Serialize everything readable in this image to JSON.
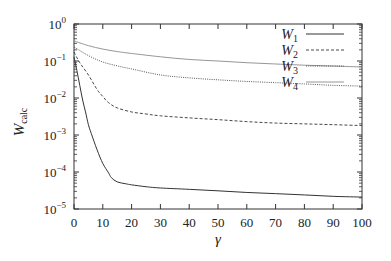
{
  "chart_data": {
    "type": "line",
    "title": "",
    "xlabel": "γ",
    "ylabel": "W",
    "ylabel_subscript": "calc",
    "xlim": [
      0,
      100
    ],
    "ylim": [
      1e-05,
      1
    ],
    "yscale": "log",
    "grid": false,
    "legend_position": "upper right",
    "x_ticks": [
      0,
      10,
      20,
      30,
      40,
      50,
      60,
      70,
      80,
      90,
      100
    ],
    "x_tick_labels": [
      "0",
      "10",
      "20",
      "30",
      "40",
      "50",
      "60",
      "70",
      "80",
      "90",
      "100"
    ],
    "y_ticks": [
      1,
      0.1,
      0.01,
      0.001,
      0.0001,
      1e-05
    ],
    "y_tick_labels": [
      {
        "base": "10",
        "exp": "0"
      },
      {
        "base": "10",
        "exp": "−1"
      },
      {
        "base": "10",
        "exp": "−2"
      },
      {
        "base": "10",
        "exp": "−3"
      },
      {
        "base": "10",
        "exp": "−4"
      },
      {
        "base": "10",
        "exp": "−5"
      }
    ],
    "series": [
      {
        "name": "W1",
        "label_base": "W",
        "label_sub": "1",
        "style": "solid",
        "color": "#333333",
        "width": 1.0,
        "x": [
          0,
          1,
          2,
          3,
          4,
          5,
          6,
          8,
          10,
          12,
          13,
          15,
          18,
          20,
          25,
          30,
          40,
          50,
          60,
          70,
          80,
          90,
          100
        ],
        "y": [
          0.13,
          0.055,
          0.022,
          0.0088,
          0.0042,
          0.0019,
          0.0011,
          0.0004,
          0.00017,
          9.5e-05,
          7e-05,
          5.4e-05,
          4.8e-05,
          4.5e-05,
          4e-05,
          3.7e-05,
          3.4e-05,
          3.1e-05,
          2.8e-05,
          2.6e-05,
          2.4e-05,
          2.2e-05,
          2.1e-05
        ]
      },
      {
        "name": "W2",
        "label_base": "W",
        "label_sub": "2",
        "style": "dashed",
        "color": "#333333",
        "width": 0.9,
        "x": [
          0,
          2,
          5,
          8,
          10,
          12,
          15,
          20,
          25,
          30,
          40,
          50,
          60,
          70,
          80,
          90,
          100
        ],
        "y": [
          0.175,
          0.09,
          0.042,
          0.017,
          0.011,
          0.0075,
          0.0054,
          0.0042,
          0.0037,
          0.0033,
          0.0029,
          0.0026,
          0.0023,
          0.0021,
          0.002,
          0.0019,
          0.0018
        ]
      },
      {
        "name": "W3",
        "label_base": "W",
        "label_sub": "3",
        "style": "dotted",
        "color": "#444444",
        "width": 0.9,
        "x": [
          0,
          5,
          10,
          15,
          20,
          30,
          40,
          50,
          60,
          70,
          80,
          90,
          100
        ],
        "y": [
          0.24,
          0.14,
          0.094,
          0.074,
          0.061,
          0.042,
          0.035,
          0.031,
          0.028,
          0.026,
          0.024,
          0.022,
          0.021
        ]
      },
      {
        "name": "W4",
        "label_base": "W",
        "label_sub": "4",
        "style": "solid",
        "color": "#8a8a8a",
        "width": 0.9,
        "x": [
          0,
          5,
          10,
          15,
          20,
          30,
          40,
          50,
          60,
          70,
          80,
          90,
          100
        ],
        "y": [
          0.35,
          0.26,
          0.21,
          0.18,
          0.16,
          0.13,
          0.11,
          0.1,
          0.09,
          0.083,
          0.077,
          0.073,
          0.069
        ]
      }
    ]
  }
}
